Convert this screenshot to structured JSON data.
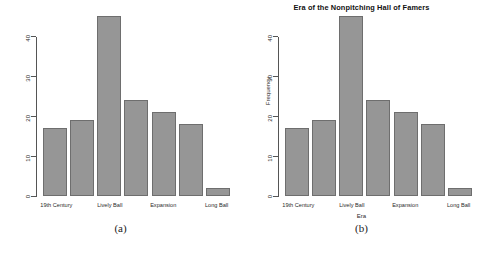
{
  "figure": {
    "panels": [
      {
        "caption": "(a)",
        "title": "",
        "xlabel": "",
        "ylabel": "",
        "y_ticks": [
          "0",
          "10",
          "20",
          "30",
          "40"
        ],
        "x_tick_labels": [
          "19th Century",
          "Lively Ball",
          "Expansion",
          "Long Ball"
        ]
      },
      {
        "caption": "(b)",
        "title": "Era of the Nonpitching Hall of Famers",
        "xlabel": "Era",
        "ylabel": "Frequency",
        "y_ticks": [
          "0",
          "10",
          "20",
          "30",
          "40"
        ],
        "x_tick_labels": [
          "19th Century",
          "Lively Ball",
          "Expansion",
          "Long Ball"
        ]
      }
    ]
  },
  "style": {
    "bar_fill": "#969696",
    "bar_border": "#6e6e6e",
    "axis_color": "#555555",
    "background": "#ffffff"
  },
  "chart_data": [
    {
      "type": "bar",
      "title": "",
      "xlabel": "",
      "ylabel": "",
      "categories": [
        "19th Century",
        "",
        "Lively Ball",
        "",
        "Expansion",
        "",
        "Long Ball"
      ],
      "values": [
        17,
        19,
        45,
        24,
        21,
        18,
        2
      ],
      "ylim": [
        0,
        45
      ],
      "yticks": [
        0,
        10,
        20,
        30,
        40
      ],
      "grid": false,
      "legend": "none"
    },
    {
      "type": "bar",
      "title": "Era of the Nonpitching Hall of Famers",
      "xlabel": "Era",
      "ylabel": "Frequency",
      "categories": [
        "19th Century",
        "",
        "Lively Ball",
        "",
        "Expansion",
        "",
        "Long Ball"
      ],
      "values": [
        17,
        19,
        45,
        24,
        21,
        18,
        2
      ],
      "ylim": [
        0,
        45
      ],
      "yticks": [
        0,
        10,
        20,
        30,
        40
      ],
      "grid": false,
      "legend": "none"
    }
  ]
}
